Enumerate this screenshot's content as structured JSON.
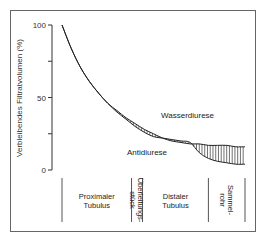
{
  "chart_data": {
    "type": "line",
    "title": "",
    "xlabel": "",
    "ylabel": "Verbleibendes Filtratvolumen (%)",
    "ylim": [
      0,
      100
    ],
    "yticks": [
      0,
      25,
      50,
      75,
      100
    ],
    "ytick_labels": [
      "0",
      "",
      "50",
      "",
      "100"
    ],
    "grid": false,
    "x_domain": [
      0,
      100
    ],
    "segments": [
      {
        "name": "proximal",
        "label": [
          "Proximaler",
          "Tubulus"
        ],
        "x_start": 0,
        "x_end": 38,
        "orientation": "horizontal"
      },
      {
        "name": "ueberleitung",
        "label": [
          "Überleitungs-",
          "stück"
        ],
        "x_start": 38,
        "x_end": 44,
        "orientation": "vertical"
      },
      {
        "name": "distal",
        "label": [
          "Distaler",
          "Tubulus"
        ],
        "x_start": 44,
        "x_end": 80,
        "orientation": "horizontal"
      },
      {
        "name": "sammelrohr",
        "label": [
          "Sammel-",
          "rohr"
        ],
        "x_start": 80,
        "x_end": 100,
        "orientation": "vertical"
      }
    ],
    "series": [
      {
        "name": "Wasserdiurese",
        "x": [
          0,
          5,
          10,
          15,
          20,
          25,
          30,
          35,
          40,
          45,
          50,
          55,
          60,
          65,
          70,
          75,
          80,
          85,
          90,
          95,
          100
        ],
        "y": [
          100,
          84,
          71,
          61,
          53,
          46,
          41,
          36,
          32,
          28,
          25,
          22,
          20,
          19,
          18,
          18,
          17,
          17,
          17,
          16,
          16
        ]
      },
      {
        "name": "Antidiurese",
        "x": [
          0,
          5,
          10,
          15,
          20,
          25,
          30,
          35,
          40,
          45,
          50,
          55,
          60,
          65,
          70,
          75,
          80,
          85,
          90,
          95,
          100
        ],
        "y": [
          100,
          84,
          71,
          61,
          53,
          46,
          40,
          35,
          30,
          26,
          23,
          22,
          21,
          20,
          19,
          12,
          8,
          6,
          5,
          4,
          4
        ]
      }
    ],
    "annotations": [
      {
        "text": "Wasserdiurese",
        "near": "upper curve, distal tubulus"
      },
      {
        "text": "Antidiurese",
        "near": "lower curve, distal tubulus"
      }
    ],
    "hatched_area_between_series": true
  }
}
